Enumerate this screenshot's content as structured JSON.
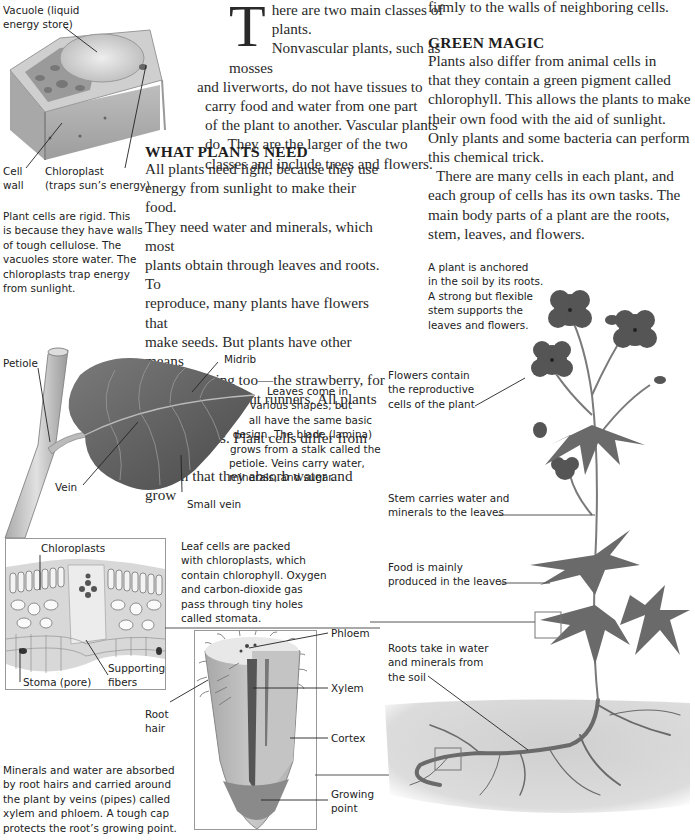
{
  "col1": {
    "intro_dropcap": "T",
    "intro_lines": [
      "here are two main classes of plants.",
      "Nonvascular plants, such as mosses",
      "and liverworts, do not have tissues to",
      "carry food and water from one part",
      "of the plant to another. Vascular plants",
      "do. They are the larger of the two",
      "classes and include trees and flowers."
    ],
    "heading": "WHAT PLANTS NEED",
    "needs_lines": [
      "All plants need light, because they use",
      "energy from sunlight to make their food.",
      "They need water and minerals, which most",
      "plants obtain through leaves and roots. To",
      "reproduce, many plants have flowers that",
      "make seeds. But plants have other means",
      "of reproducing too—the strawberry, for",
      "example, sends out runners. All plants are",
      "made of cells. Plant cells differ from animal",
      "cells in that they absorb water and grow"
    ]
  },
  "col2": {
    "cont_line": "firmly to the walls of neighboring cells.",
    "heading": "GREEN MAGIC",
    "magic_lines": [
      "Plants also differ from animal cells in",
      "that they contain a green pigment called",
      "chlorophyll. This allows the plants to make",
      "their own food with the aid of sunlight.",
      "Only plants and some bacteria can perform",
      "this chemical trick."
    ],
    "cells_lines": [
      "There are many cells in each plant, and",
      "each group of cells has its own tasks. The",
      "main body parts of a plant are the roots,",
      "stem, leaves, and flowers."
    ]
  },
  "cell_figure": {
    "label_vacuole": [
      "Vacuole (liquid",
      "energy store)"
    ],
    "label_cell_wall": [
      "Cell",
      "wall"
    ],
    "label_chloroplast": [
      "Chloroplast",
      "(traps sun’s energy)"
    ],
    "caption": [
      "Plant cells are rigid. This",
      "is because they have walls",
      "of tough cellulose. The",
      "vacuoles store water. The",
      "chloroplasts trap energy",
      "from sunlight."
    ]
  },
  "leaf_figure": {
    "label_petiole": "Petiole",
    "label_midrib": "Midrib",
    "label_vein": "Vein",
    "label_small_vein": "Small vein",
    "caption": [
      "Leaves come in",
      "various shapes, but",
      "all have the same basic",
      "design. The blade (lamina)",
      "grows from a stalk called the",
      "petiole. Veins carry water,",
      "minerals, and sugar."
    ]
  },
  "leaf_section_figure": {
    "label_chloroplasts": "Chloroplasts",
    "label_supporting_fibers": [
      "Supporting",
      "fibers"
    ],
    "label_stoma": "Stoma (pore)",
    "caption": [
      "Leaf cells are packed",
      "with chloroplasts, which",
      "contain chlorophyll. Oxygen",
      "and carbon-dioxide gas",
      "pass through tiny holes",
      "called stomata."
    ]
  },
  "root_figure": {
    "label_phloem": "Phloem",
    "label_xylem": "Xylem",
    "label_cortex": "Cortex",
    "label_growing_point": [
      "Growing",
      "point"
    ],
    "label_root_hair": [
      "Root",
      "hair"
    ],
    "caption": [
      "Minerals and water are absorbed",
      "by root hairs and carried around",
      "the plant by veins (pipes) called",
      "xylem and phloem. A tough cap",
      "protects the root’s growing point."
    ]
  },
  "plant_figure": {
    "caption": [
      "A plant is anchored",
      "in the soil by its roots.",
      "A strong but flexible",
      "stem supports the",
      "leaves and flowers."
    ],
    "label_flowers": [
      "Flowers contain",
      "the reproductive",
      "cells of the plant"
    ],
    "label_stem": [
      "Stem carries water and",
      "minerals to the leaves"
    ],
    "label_food": [
      "Food is mainly",
      "produced in the leaves"
    ],
    "label_roots": [
      "Roots take in water",
      "and minerals from",
      "the soil"
    ]
  },
  "colors": {
    "text": "#2a2a2a",
    "illustration_dark": "#555555",
    "illustration_mid": "#8a8a8a",
    "illustration_light": "#c8c8c8",
    "soil": "#d6d6d6"
  }
}
